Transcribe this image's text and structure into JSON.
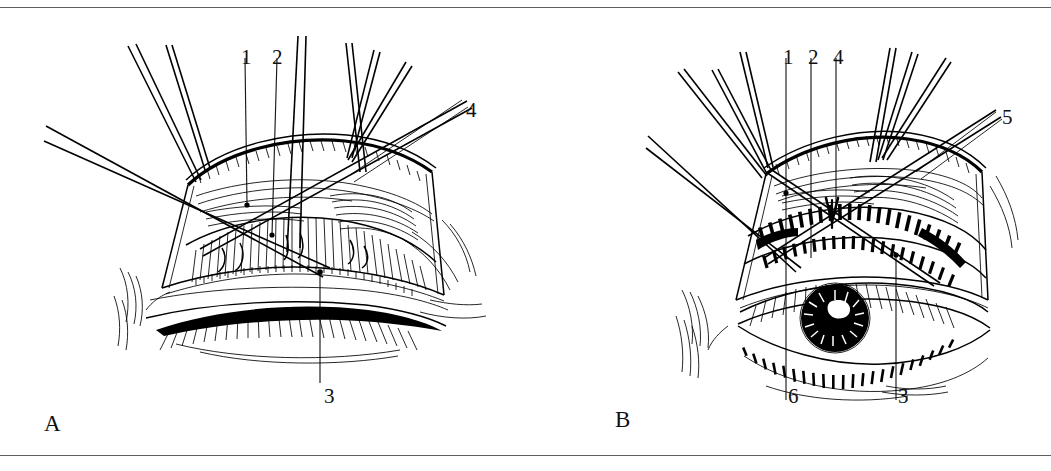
{
  "figure": {
    "type": "line-drawing",
    "background_color": "#ffffff",
    "ink_color": "#000000",
    "rule_color": "#5e5e5e"
  },
  "panels": [
    {
      "id": "A",
      "letter": "A",
      "description": "Everted upper eyelid retracted with sutures, eye closed beneath, tarsal plate and conjunctiva exposed",
      "labels": [
        {
          "text": "1",
          "x": 241,
          "y": 50
        },
        {
          "text": "2",
          "x": 271,
          "y": 50
        },
        {
          "text": "4",
          "x": 466,
          "y": 105
        },
        {
          "text": "3",
          "x": 323,
          "y": 390
        }
      ]
    },
    {
      "id": "B",
      "letter": "B",
      "description": "Everted upper eyelid retracted with sutures, eye open showing iris and pupil, meibomian glands visible on tarsus",
      "labels": [
        {
          "text": "1",
          "x": 783,
          "y": 50
        },
        {
          "text": "2",
          "x": 808,
          "y": 50
        },
        {
          "text": "4",
          "x": 833,
          "y": 50
        },
        {
          "text": "5",
          "x": 1002,
          "y": 112
        },
        {
          "text": "6",
          "x": 785,
          "y": 390
        },
        {
          "text": "3",
          "x": 895,
          "y": 390
        }
      ]
    }
  ],
  "annotation_markers": {
    "arrow_marker": "down-arrowhead",
    "arrow_panel": "B"
  }
}
